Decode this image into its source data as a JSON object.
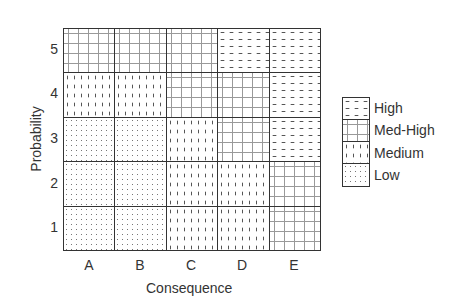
{
  "chart_data": {
    "type": "heatmap",
    "title": "",
    "xlabel": "Consequence",
    "ylabel": "Probability",
    "x_categories": [
      "A",
      "B",
      "C",
      "D",
      "E"
    ],
    "y_categories": [
      "1",
      "2",
      "3",
      "4",
      "5"
    ],
    "levels": [
      "Low",
      "Medium",
      "Med-High",
      "High"
    ],
    "grid": {
      "5": [
        "Med-High",
        "Med-High",
        "Med-High",
        "High",
        "High"
      ],
      "4": [
        "Medium",
        "Medium",
        "Med-High",
        "Med-High",
        "High"
      ],
      "3": [
        "Low",
        "Low",
        "Medium",
        "Med-High",
        "High"
      ],
      "2": [
        "Low",
        "Low",
        "Medium",
        "Medium",
        "Med-High"
      ],
      "1": [
        "Low",
        "Low",
        "Medium",
        "Medium",
        "Med-High"
      ]
    },
    "legend": {
      "position": "right",
      "entries": [
        "High",
        "Med-High",
        "Medium",
        "Low"
      ]
    }
  },
  "labels": {
    "xlabel": "Consequence",
    "ylabel": "Probability",
    "xticks": [
      "A",
      "B",
      "C",
      "D",
      "E"
    ],
    "yticks": [
      "5",
      "4",
      "3",
      "2",
      "1"
    ],
    "legend": [
      "High",
      "Med-High",
      "Medium",
      "Low"
    ]
  }
}
